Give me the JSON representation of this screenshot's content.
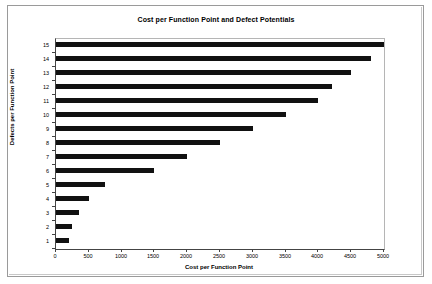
{
  "chart_data": {
    "type": "bar",
    "orientation": "horizontal",
    "title": "Cost per Function Point and Defect Potentials",
    "xlabel": "Cost per Function Point",
    "ylabel": "Defects per Function Point",
    "categories": [
      "1",
      "2",
      "3",
      "4",
      "5",
      "6",
      "7",
      "8",
      "9",
      "10",
      "11",
      "12",
      "13",
      "14",
      "15"
    ],
    "values": [
      200,
      250,
      350,
      500,
      750,
      1500,
      2000,
      2500,
      3000,
      3500,
      4000,
      4200,
      4500,
      4800,
      5000
    ],
    "xlim": [
      0,
      5000
    ],
    "xticks": [
      0,
      500,
      1000,
      1500,
      2000,
      2500,
      3000,
      3500,
      4000,
      4500,
      5000
    ],
    "xtick_labels": [
      "0",
      "500",
      "1000",
      "1500",
      "2000",
      "2500",
      "3000",
      "3500",
      "4000",
      "4500",
      "5000"
    ],
    "ytick_labels": [
      "1",
      "2",
      "3",
      "4",
      "5",
      "6",
      "7",
      "8",
      "9",
      "10",
      "11",
      "12",
      "13",
      "14",
      "15"
    ],
    "grid": false,
    "legend": false,
    "bar_color": "#111111",
    "plot_background": "#ffffff",
    "axis_color": "#444444"
  }
}
